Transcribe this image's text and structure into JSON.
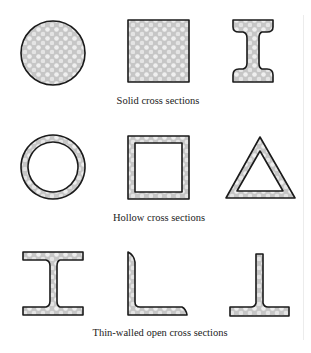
{
  "figure": {
    "colors": {
      "outline": "#1a1a1a",
      "fill": "#c8c8c8",
      "fill_highlight": "#f2f2f2",
      "background": "#ffffff",
      "text": "#222222"
    },
    "groups": [
      {
        "caption": "Solid cross sections",
        "shapes": [
          "solid-circle",
          "solid-square",
          "solid-i-section"
        ]
      },
      {
        "caption": "Hollow cross sections",
        "shapes": [
          "hollow-circle",
          "hollow-square",
          "hollow-triangle"
        ]
      },
      {
        "caption": "Thin-walled open cross sections",
        "shapes": [
          "thin-walled-i-beam",
          "thin-walled-angle",
          "thin-walled-inverted-tee"
        ]
      }
    ]
  }
}
